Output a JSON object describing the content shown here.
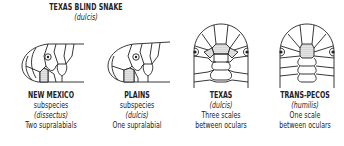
{
  "header": {
    "title": "TEXAS BLIND SNAKE",
    "subtitle": "(dulcis)"
  },
  "figures": [
    {
      "id": "new-mexico",
      "view": "lateral",
      "caption": [
        "NEW MEXICO",
        "subspecies",
        "(dissectus)",
        "Two supralabials"
      ]
    },
    {
      "id": "plains",
      "view": "lateral",
      "caption": [
        "PLAINS",
        "subspecies",
        "(dulcis)",
        "One supralabial"
      ]
    },
    {
      "id": "texas",
      "view": "dorsal",
      "caption": [
        "TEXAS",
        "(dulcis)",
        "Three scales",
        "between oculars"
      ]
    },
    {
      "id": "trans-pecos",
      "view": "dorsal",
      "caption": [
        "TRANS-PECOS",
        "(humilis)",
        "One scale",
        "between oculars"
      ]
    }
  ],
  "colors": {
    "line": "#222222",
    "shaded_scale": "#9a9a9a"
  }
}
